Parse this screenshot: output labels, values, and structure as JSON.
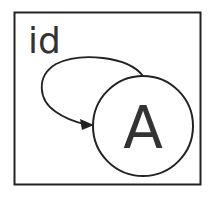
{
  "diagram": {
    "frame_label": "id",
    "node": {
      "label": "A"
    },
    "edge": {
      "type": "self-loop",
      "from": "frame",
      "to": "A"
    },
    "colors": {
      "stroke": "#222222",
      "text": "#333333",
      "background": "#ffffff"
    }
  }
}
